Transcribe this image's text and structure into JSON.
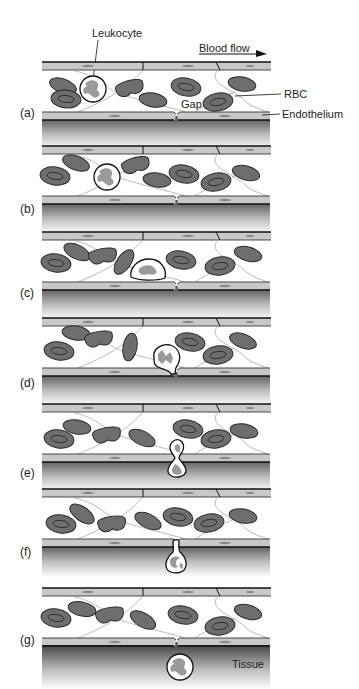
{
  "figure": {
    "labels": {
      "leukocyte": "Leukocyte",
      "blood_flow": "Blood flow",
      "rbc": "RBC",
      "gap": "Gap",
      "endothelium": "Endothelium",
      "tissue": "Tissue"
    },
    "panels": [
      {
        "id": "a",
        "label": "(a)",
        "stage": "leukocyte-flowing"
      },
      {
        "id": "b",
        "label": "(b)",
        "stage": "leukocyte-approaching-wall"
      },
      {
        "id": "c",
        "label": "(c)",
        "stage": "leukocyte-adhering"
      },
      {
        "id": "d",
        "label": "(d)",
        "stage": "leukocyte-entering-gap"
      },
      {
        "id": "e",
        "label": "(e)",
        "stage": "leukocyte-squeezing-through"
      },
      {
        "id": "f",
        "label": "(f)",
        "stage": "leukocyte-mostly-through"
      },
      {
        "id": "g",
        "label": "(g)",
        "stage": "leukocyte-in-tissue"
      }
    ],
    "colors": {
      "wall_fill": "#c8c8c8",
      "wall_line": "#111111",
      "rbc_fill": "#6e6e6e",
      "rbc_stroke": "#2a2a2a",
      "fiber": "#a8a8a8",
      "tissue_top": "#5a5a5a",
      "tissue_bottom": "#ffffff",
      "leukocyte_nucleus": "#9a9a9a"
    }
  }
}
